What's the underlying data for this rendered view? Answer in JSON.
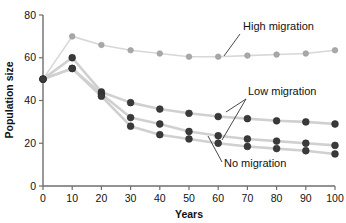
{
  "chart_data": {
    "type": "line",
    "title": "",
    "xlabel": "Years",
    "ylabel": "Population size",
    "x": [
      0,
      10,
      20,
      30,
      40,
      50,
      60,
      70,
      80,
      90,
      100
    ],
    "xlim": [
      0,
      100
    ],
    "ylim": [
      0,
      80
    ],
    "xticks": [
      0,
      10,
      20,
      30,
      40,
      50,
      60,
      70,
      80,
      90,
      100
    ],
    "yticks": [
      0,
      20,
      40,
      60,
      80
    ],
    "grid": false,
    "legend_position": "annotations-inline",
    "series": [
      {
        "name": "High migration",
        "color": "#a8a8a8",
        "marker_color": "#a8a8a8",
        "values": [
          50,
          70,
          66,
          63.5,
          62,
          60.5,
          60.5,
          61,
          61.5,
          62,
          63.5
        ]
      },
      {
        "name": "Low migration (upper)",
        "color": "#3a3a3a",
        "marker_color": "#3a3a3a",
        "values": [
          50,
          60,
          44,
          39,
          36,
          34,
          32.5,
          31.5,
          30.5,
          30,
          29
        ]
      },
      {
        "name": "Low migration (lower)",
        "color": "#3a3a3a",
        "marker_color": "#3a3a3a",
        "values": [
          50,
          55,
          43,
          32,
          29,
          25.5,
          23.5,
          22,
          21,
          20,
          19
        ]
      },
      {
        "name": "No migration",
        "color": "#3a3a3a",
        "marker_color": "#3a3a3a",
        "values": [
          50,
          55,
          42,
          28,
          24,
          22,
          20,
          18.5,
          17.5,
          16.5,
          15
        ]
      }
    ],
    "annotations": [
      {
        "text": "High migration",
        "x_px": 245,
        "y_px": 31
      },
      {
        "text": "Low migration",
        "x_px": 250,
        "y_px": 94
      },
      {
        "text": "No migration",
        "x_px": 228,
        "y_px": 166
      }
    ]
  },
  "axes": {
    "y_label": "Population size",
    "x_label": "Years",
    "y_tick_labels": [
      "0",
      "20",
      "40",
      "60",
      "80"
    ],
    "x_tick_labels": [
      "0",
      "10",
      "20",
      "30",
      "40",
      "50",
      "60",
      "70",
      "80",
      "90",
      "100"
    ]
  },
  "annotations": {
    "high": "High migration",
    "low": "Low migration",
    "none": "No migration"
  },
  "colors": {
    "light_series": "#a8a8a8",
    "dark_series": "#3a3a3a",
    "connector": "#d0d0d0",
    "axis": "#6e6e6e",
    "text": "#111111"
  }
}
